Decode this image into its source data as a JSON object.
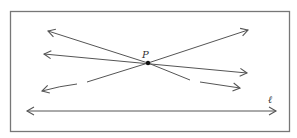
{
  "diagram": {
    "type": "geometry-lines-through-point",
    "point": {
      "label": "P",
      "x": 148,
      "y": 63
    },
    "line_label": "ℓ",
    "frame": {
      "x": 10,
      "y": 11,
      "width": 280,
      "height": 121
    },
    "colors": {
      "stroke": "#555555",
      "frame": "#777777",
      "point": "#111111",
      "text": "#333333"
    },
    "lines": [
      {
        "name": "line-through-p-1",
        "from": [
          48,
          31
        ],
        "to": [
          240,
          88
        ],
        "dashed_segment": true
      },
      {
        "name": "line-through-p-2",
        "from": [
          44,
          54
        ],
        "to": [
          247,
          73
        ],
        "dashed_segment": false
      },
      {
        "name": "line-through-p-3",
        "from": [
          42,
          91
        ],
        "to": [
          248,
          30
        ],
        "dashed_segment": true
      },
      {
        "name": "line-l",
        "from": [
          27,
          111
        ],
        "to": [
          276,
          111
        ],
        "dashed_segment": false
      }
    ]
  }
}
